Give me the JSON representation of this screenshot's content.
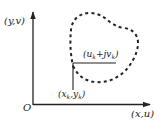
{
  "diagram": {
    "axes": {
      "vertical_label": "(y,v)",
      "horizontal_label": "(x,u)",
      "origin_label": "O"
    },
    "points": {
      "source_label_main": "(x",
      "source_sub1": "k",
      "source_mid": ",y",
      "source_sub2": "k",
      "source_end": ")",
      "target_label_main": "(u",
      "target_sub1": "k",
      "target_mid": "+jv",
      "target_sub2": "k",
      "target_end": ")"
    },
    "colors": {
      "stroke": "#222222",
      "curve": "#222222",
      "background": "#ffffff"
    }
  }
}
